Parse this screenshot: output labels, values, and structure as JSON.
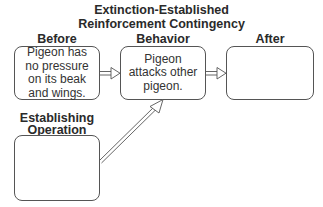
{
  "title": {
    "line1": "Extinction-Established",
    "line2": "Reinforcement Contingency"
  },
  "columns": {
    "before": {
      "label": "Before",
      "text": "Pigeon has no pressure on its beak and wings."
    },
    "behavior": {
      "label": "Behavior",
      "text": "Pigeon attacks other pigeon."
    },
    "after": {
      "label": "After",
      "text": ""
    }
  },
  "establishing_operation": {
    "label_line1": "Establishing",
    "label_line2": "Operation",
    "text": ""
  },
  "arrows": [
    {
      "from": "before",
      "to": "behavior",
      "style": "double-line-hollow-head"
    },
    {
      "from": "behavior",
      "to": "after",
      "style": "double-line-hollow-head"
    },
    {
      "from": "establishing_operation",
      "to": "behavior",
      "style": "double-line-hollow-head"
    }
  ]
}
